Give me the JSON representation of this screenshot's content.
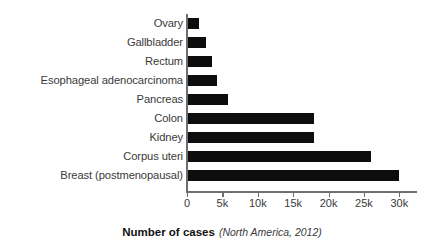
{
  "chart_data": {
    "type": "bar",
    "orientation": "horizontal",
    "title": "",
    "xlabel": "Number of cases",
    "xlabel_note": "(North America, 2012)",
    "ylabel": "",
    "categories": [
      "Ovary",
      "Gallbladder",
      "Rectum",
      "Esophageal adenocarcinoma",
      "Pancreas",
      "Colon",
      "Kidney",
      "Corpus uteri",
      "Breast (postmenopausal)"
    ],
    "values": [
      1700,
      2700,
      3500,
      4200,
      5800,
      18000,
      18000,
      26000,
      30000
    ],
    "xlim": [
      0,
      32500
    ],
    "xticks": [
      0,
      5000,
      10000,
      15000,
      20000,
      25000,
      30000
    ],
    "xticklabels": [
      "0",
      "5k",
      "10k",
      "15k",
      "20k",
      "25k",
      "30k"
    ],
    "grid": false,
    "legend": null,
    "bar_color": "#0d0d0d",
    "axis_color": "#6e6e6e",
    "text_color": "#3a3a3a",
    "background": "#ffffff"
  }
}
